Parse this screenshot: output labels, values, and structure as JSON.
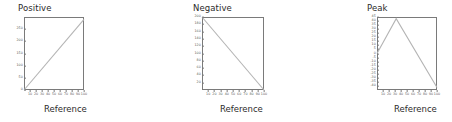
{
  "figure": {
    "xlabel": "Reference",
    "line_color": "#b4b4b4",
    "frame_color": "#7a7a7a",
    "tick_color": "#5a5a5a",
    "title_color": "#2b2b2b",
    "point_color": "#b4b4b4",
    "background": "#ffffff"
  },
  "chart_data": [
    {
      "type": "line",
      "title": "Positive",
      "xlabel": "Reference",
      "ylabel": "",
      "xlim": [
        0,
        100
      ],
      "ylim": [
        0,
        300
      ],
      "xticks": [
        10,
        20,
        30,
        40,
        50,
        60,
        70,
        80,
        90,
        100
      ],
      "yticks": [
        0,
        50,
        100,
        150,
        200,
        250
      ],
      "ytick_labels": [
        "0",
        "50",
        "100",
        "150",
        "200",
        "250"
      ],
      "grid": false,
      "legend": "none",
      "x": [
        0,
        100
      ],
      "values": [
        0,
        290
      ]
    },
    {
      "type": "line",
      "title": "Negative",
      "xlabel": "Reference",
      "ylabel": "",
      "xlim": [
        0,
        100
      ],
      "ylim": [
        0,
        200
      ],
      "xticks": [
        10,
        20,
        30,
        40,
        50,
        60,
        70,
        80,
        90,
        100
      ],
      "yticks": [
        20,
        40,
        60,
        80,
        100,
        120,
        140,
        160,
        180,
        200
      ],
      "ytick_labels": [
        "20",
        "40",
        "60",
        "80",
        "100",
        "120",
        "140",
        "160",
        "180",
        "200"
      ],
      "grid": false,
      "legend": "none",
      "x": [
        0,
        100
      ],
      "values": [
        200,
        0
      ]
    },
    {
      "type": "line",
      "title": "Peak",
      "xlabel": "Reference",
      "ylabel": "",
      "xlim": [
        0,
        100
      ],
      "ylim": [
        -45,
        45
      ],
      "xticks": [
        10,
        20,
        30,
        40,
        50,
        60,
        70,
        80,
        90,
        100
      ],
      "yticks": [
        -40,
        -35,
        -30,
        -25,
        -20,
        -15,
        -10,
        -5,
        0,
        5,
        10,
        15,
        20,
        25,
        30,
        35,
        40,
        45
      ],
      "ytick_labels": [
        "-40",
        "-35",
        "-30",
        "-25",
        "-20",
        "-15",
        "-10",
        "-5",
        "0",
        "5",
        "10",
        "15",
        "20",
        "25",
        "30",
        "35",
        "40",
        "45"
      ],
      "grid": false,
      "legend": "none",
      "x": [
        0,
        32,
        100
      ],
      "values": [
        0,
        43,
        -42
      ]
    },
    {
      "type": "line",
      "title": "Valley",
      "xlabel": "Reference",
      "ylabel": "",
      "xlim": [
        0,
        100
      ],
      "ylim": [
        80,
        200
      ],
      "xticks": [
        10,
        20,
        30,
        40,
        50,
        60,
        70,
        80,
        90,
        100
      ],
      "yticks": [
        80,
        90,
        100,
        110,
        120,
        130,
        140,
        150,
        160,
        170,
        180,
        190,
        200
      ],
      "ytick_labels": [
        "80",
        "90",
        "100",
        "110",
        "120",
        "130",
        "140",
        "150",
        "160",
        "170",
        "180",
        "190",
        "200"
      ],
      "grid": false,
      "legend": "none",
      "x": [
        0,
        60,
        100
      ],
      "values": [
        200,
        82,
        155
      ]
    },
    {
      "type": "scatter",
      "title": "Outlier",
      "xlabel": "Reference",
      "ylabel": "",
      "xlim": [
        0,
        100
      ],
      "ylim": [
        0,
        85
      ],
      "xticks": [
        10,
        20,
        30,
        40,
        50,
        60,
        70,
        80,
        90,
        100
      ],
      "yticks": [
        20,
        40,
        60,
        80
      ],
      "ytick_labels": [
        "20",
        "40",
        "60",
        "80"
      ],
      "grid": false,
      "legend": "none",
      "x": [
        8,
        9,
        11,
        12,
        13,
        15,
        16,
        17,
        18,
        19,
        20,
        21,
        22,
        23,
        24,
        25,
        26,
        27,
        28,
        29,
        30,
        31,
        32,
        33,
        34,
        35,
        36,
        37,
        38,
        39,
        40,
        41,
        42,
        43,
        44,
        45,
        46,
        47,
        48,
        49,
        50,
        51,
        52,
        53,
        54,
        55,
        56,
        57,
        58,
        59,
        60,
        61,
        62,
        63,
        64,
        65,
        66,
        67,
        68,
        69,
        70,
        71,
        72,
        73,
        74,
        75,
        76,
        77,
        78,
        79,
        80,
        81,
        82,
        83,
        84,
        85,
        86,
        87,
        88,
        89,
        90,
        91,
        92,
        93,
        94,
        95,
        96,
        97,
        98,
        52
      ],
      "values": [
        4,
        3,
        5,
        4,
        3,
        16,
        4,
        5,
        18,
        3,
        15,
        20,
        4,
        17,
        5,
        14,
        19,
        4,
        16,
        3,
        21,
        5,
        15,
        18,
        4,
        13,
        17,
        3,
        20,
        5,
        14,
        4,
        16,
        19,
        3,
        12,
        18,
        5,
        15,
        4,
        17,
        3,
        20,
        14,
        5,
        16,
        4,
        13,
        19,
        3,
        15,
        5,
        18,
        4,
        12,
        17,
        3,
        20,
        14,
        5,
        16,
        4,
        19,
        3,
        13,
        18,
        5,
        15,
        4,
        21,
        16,
        3,
        14,
        5,
        19,
        4,
        17,
        3,
        13,
        18,
        5,
        15,
        4,
        20,
        3,
        16,
        5,
        14,
        4,
        78
      ],
      "annotation": "single high outlier point near top of panel"
    }
  ]
}
